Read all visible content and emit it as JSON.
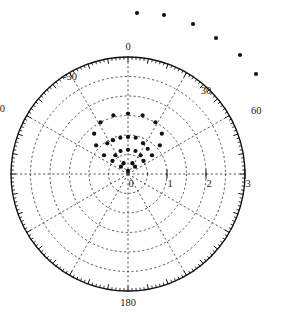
{
  "figure": {
    "title": "",
    "background_color": "#ffffff",
    "marker_color": "#111111",
    "grid_color": "#2a2a2a",
    "axis_color": "#111111"
  },
  "chart_data": {
    "type": "scatter",
    "projection": "polar",
    "title": "",
    "xlabel": "",
    "ylabel": "",
    "angle_unit": "degrees",
    "angle_labels": [
      "0",
      "30",
      "60",
      "180",
      "-30",
      "-60"
    ],
    "angle_tick_values": [
      0,
      30,
      60,
      180,
      -30,
      -60
    ],
    "angle_label_positions": {
      "0": "top",
      "30": "upper-right",
      "60": "right",
      "180": "bottom",
      "-30": "upper-left",
      "-60": "left"
    },
    "radial_labels": [
      "0",
      "1",
      "2",
      "3"
    ],
    "radial_tick_values": [
      0,
      1,
      2,
      3
    ],
    "rlim": [
      0,
      3
    ],
    "theta_zero_location": "N",
    "theta_direction": "clockwise",
    "grid": true,
    "grid_style": "dashed",
    "grid_circles_r": [
      0.5,
      1,
      1.5,
      2,
      2.5,
      3
    ],
    "grid_spokes_deg": [
      0,
      30,
      60,
      90,
      120,
      150,
      180,
      -30,
      -60,
      -90,
      -120,
      -150
    ],
    "legend": "none",
    "series": [
      {
        "name": "in-range points",
        "marker": "circle",
        "color": "#111111",
        "points_polar": [
          {
            "theta": 0,
            "r": 1.55
          },
          {
            "theta": 14,
            "r": 1.55
          },
          {
            "theta": -14,
            "r": 1.55
          },
          {
            "theta": 28,
            "r": 1.5
          },
          {
            "theta": -28,
            "r": 1.5
          },
          {
            "theta": 40,
            "r": 1.35
          },
          {
            "theta": -40,
            "r": 1.35
          },
          {
            "theta": 48,
            "r": 1.1
          },
          {
            "theta": -48,
            "r": 1.1
          },
          {
            "theta": 0,
            "r": 0.95
          },
          {
            "theta": 12,
            "r": 0.95
          },
          {
            "theta": -12,
            "r": 0.95
          },
          {
            "theta": -24,
            "r": 0.95
          },
          {
            "theta": -34,
            "r": 0.95
          },
          {
            "theta": 26,
            "r": 0.88
          },
          {
            "theta": 38,
            "r": 0.82
          },
          {
            "theta": 52,
            "r": 0.78
          },
          {
            "theta": -52,
            "r": 0.78
          },
          {
            "theta": 0,
            "r": 0.62
          },
          {
            "theta": 18,
            "r": 0.62
          },
          {
            "theta": -18,
            "r": 0.62
          },
          {
            "theta": 34,
            "r": 0.58
          },
          {
            "theta": -34,
            "r": 0.58
          },
          {
            "theta": 50,
            "r": 0.52
          },
          {
            "theta": -50,
            "r": 0.52
          },
          {
            "theta": 22,
            "r": 0.3
          },
          {
            "theta": -22,
            "r": 0.3
          },
          {
            "theta": 44,
            "r": 0.26
          },
          {
            "theta": -44,
            "r": 0.26
          },
          {
            "theta": 0,
            "r": 0.08
          }
        ]
      },
      {
        "name": "out-of-range points",
        "marker": "circle",
        "color": "#111111",
        "points_pixel": [
          {
            "x": 137,
            "y": 13
          },
          {
            "x": 164,
            "y": 15
          },
          {
            "x": 193,
            "y": 24
          },
          {
            "x": 216,
            "y": 38
          },
          {
            "x": 240,
            "y": 55
          },
          {
            "x": 256,
            "y": 74
          }
        ]
      }
    ]
  },
  "geometry": {
    "center_x": 128,
    "center_y": 174,
    "radius_px": 117
  }
}
